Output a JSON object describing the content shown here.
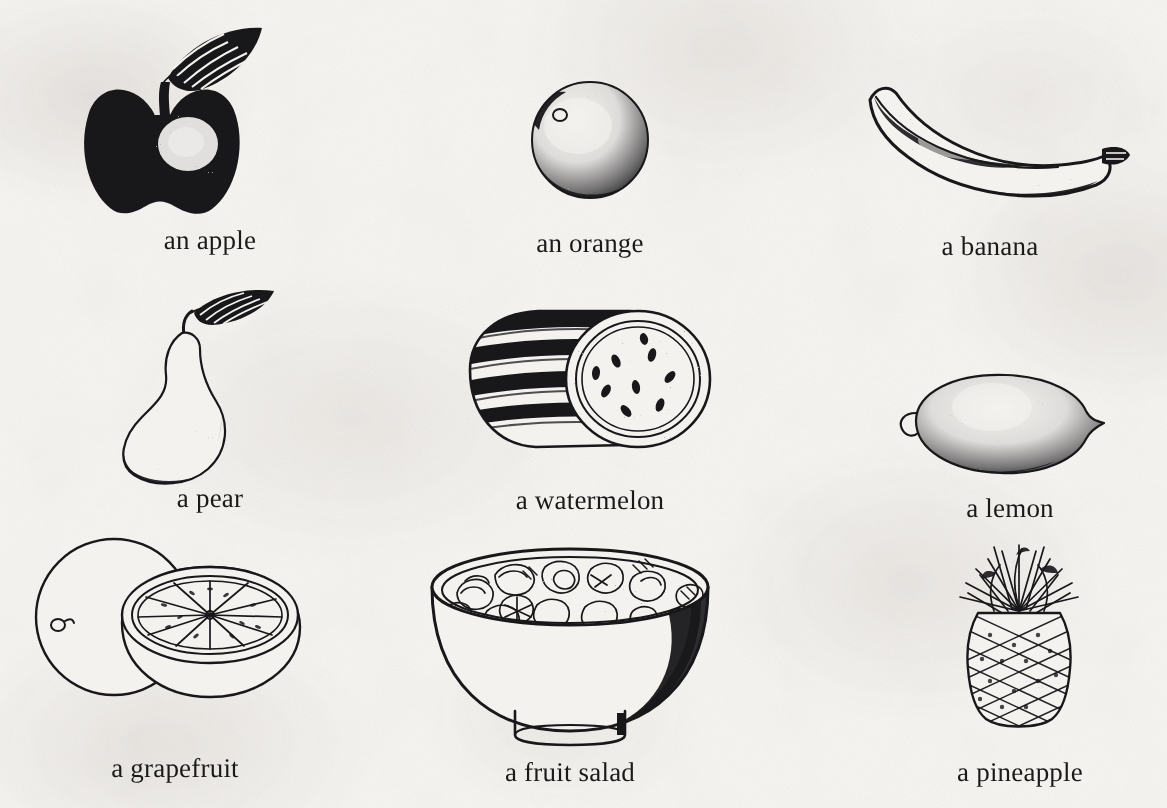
{
  "page": {
    "kind": "illustrated-vocabulary-page",
    "topic": "Fruit",
    "background_color": "#f6f4f1",
    "ink_color": "#18171a",
    "columns": 3,
    "rows": 3
  },
  "items": [
    {
      "id": "apple",
      "label": "an apple",
      "icon": "apple-illustration",
      "row": 1,
      "column": 1,
      "style": "solid-black-silhouette-with-leaf-and-highlight"
    },
    {
      "id": "orange",
      "label": "an orange",
      "icon": "orange-illustration",
      "row": 1,
      "column": 2,
      "style": "stippled-round-citrus"
    },
    {
      "id": "banana",
      "label": "a banana",
      "icon": "banana-illustration",
      "row": 1,
      "column": 3,
      "style": "stippled-curved-banana"
    },
    {
      "id": "pear",
      "label": "a pear",
      "icon": "pear-illustration",
      "row": 2,
      "column": 1,
      "style": "stippled-pear-with-leaf"
    },
    {
      "id": "watermelon",
      "label": "a watermelon",
      "icon": "watermelon-illustration",
      "row": 2,
      "column": 2,
      "style": "striped-rind-with-cut-seeded-face"
    },
    {
      "id": "lemon",
      "label": "a lemon",
      "icon": "lemon-illustration",
      "row": 2,
      "column": 3,
      "style": "stippled-lemon"
    },
    {
      "id": "grapefruit",
      "label": "a grapefruit",
      "icon": "grapefruit-illustration",
      "row": 3,
      "column": 1,
      "style": "line-art-whole-and-halved-segments"
    },
    {
      "id": "fruit-salad",
      "label": "a fruit salad",
      "icon": "fruit-salad-bowl-illustration",
      "row": 3,
      "column": 2,
      "style": "line-art-bowl-filled-with-chopped-fruit"
    },
    {
      "id": "pineapple",
      "label": "a pineapple",
      "icon": "pineapple-illustration",
      "row": 3,
      "column": 3,
      "style": "hatched-pineapple-with-crown"
    }
  ]
}
